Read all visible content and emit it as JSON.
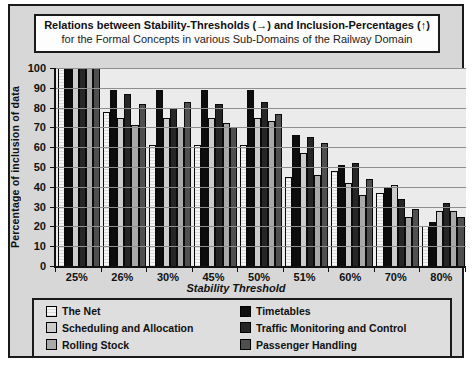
{
  "figure": {
    "title_line1": "Relations between Stability-Thresholds (→) and Inclusion-Percentages (↑)",
    "title_line2": "for the Formal Concepts in various Sub-Domains of the Railway Domain"
  },
  "chart_data": {
    "type": "bar",
    "title": "Relations between Stability-Thresholds (→) and Inclusion-Percentages (↑) for the Formal Concepts in various Sub-Domains of the Railway Domain",
    "xlabel": "Stability Threshold",
    "ylabel": "Percentage of inclusion of data",
    "ylim": [
      0,
      100
    ],
    "ytick_step": 10,
    "grid": true,
    "legend_position": "bottom",
    "categories": [
      "25%",
      "26%",
      "30%",
      "45%",
      "50%",
      "51%",
      "60%",
      "70%",
      "80%"
    ],
    "series": [
      {
        "name": "The Net",
        "color": "#f2f2f2",
        "pattern": "horizontal-lines",
        "values": [
          100,
          78,
          61,
          61,
          61,
          45,
          48,
          37,
          20
        ]
      },
      {
        "name": "Timetables",
        "color": "#0d0d0d",
        "values": [
          100,
          89,
          89,
          89,
          89,
          66,
          51,
          40,
          22
        ]
      },
      {
        "name": "Scheduling and Allocation",
        "color": "#cccccc",
        "values": [
          100,
          75,
          75,
          75,
          75,
          57,
          42,
          41,
          28
        ]
      },
      {
        "name": "Traffic Monitoring and Control",
        "color": "#262626",
        "values": [
          100,
          87,
          80,
          82,
          83,
          65,
          52,
          34,
          32
        ]
      },
      {
        "name": "Rolling Stock",
        "color": "#a9a9a9",
        "values": [
          100,
          71,
          70,
          72,
          73,
          46,
          36,
          25,
          28
        ]
      },
      {
        "name": "Passenger Handling",
        "color": "#4f4f4f",
        "values": [
          100,
          82,
          83,
          70,
          77,
          62,
          44,
          29,
          25
        ]
      }
    ]
  }
}
